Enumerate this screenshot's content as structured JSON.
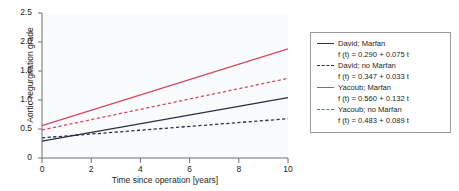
{
  "chart_data": {
    "type": "line",
    "title": "",
    "xlabel": "Time since operation [years]",
    "ylabel": "Aortic regurgitation grade",
    "xlim": [
      0,
      10
    ],
    "ylim": [
      0,
      2.5
    ],
    "xticks": [
      "0",
      "2",
      "4",
      "6",
      "8",
      "10"
    ],
    "yticks": [
      "0",
      "0.5",
      "1.0",
      "1.5",
      "2.0",
      "2.5"
    ],
    "grid": false,
    "legend_position": "right-outside",
    "x": [
      0,
      10
    ],
    "series": [
      {
        "name": "David; Marfan",
        "equation": "f (t) = 0.290 + 0.075 t",
        "intercept": 0.29,
        "slope": 0.075,
        "values": [
          0.29,
          1.04
        ],
        "color": "#2b3040",
        "style": "solid"
      },
      {
        "name": "David; no Marfan",
        "equation": "f (t) = 0.347 + 0.033 t",
        "intercept": 0.347,
        "slope": 0.033,
        "values": [
          0.347,
          0.677
        ],
        "color": "#2b3040",
        "style": "dashed"
      },
      {
        "name": "Yacoub; Marfan",
        "equation": "f (t) = 0.560 + 0.132 t",
        "intercept": 0.56,
        "slope": 0.132,
        "values": [
          0.56,
          1.88
        ],
        "color": "#d4495c",
        "style": "solid"
      },
      {
        "name": "Yacoub; no Marfan",
        "equation": "f (t) = 0.483 + 0.089 t",
        "intercept": 0.483,
        "slope": 0.089,
        "values": [
          0.483,
          1.373
        ],
        "color": "#d4495c",
        "style": "dashed"
      }
    ]
  },
  "axis": {
    "y_label": "Aortic regurgitation grade",
    "x_label": "Time since operation [years]",
    "y_ticks": [
      "2.5",
      "2.0",
      "1.5",
      "1.0",
      "0.5",
      "0"
    ],
    "x_ticks": [
      "0",
      "2",
      "4",
      "6",
      "8",
      "10"
    ]
  },
  "legend": {
    "entries": [
      {
        "label": "David; Marfan",
        "equation": "f (t) = 0.290 + 0.075 t"
      },
      {
        "label": "David; no Marfan",
        "equation": "f (t) = 0.347 + 0.033 t"
      },
      {
        "label": "Yacoub; Marfan",
        "equation": "f (t) = 0.560 + 0.132 t"
      },
      {
        "label": "Yacoub; no Marfan",
        "equation": "f (t) = 0.483 + 0.089 t"
      }
    ]
  },
  "colors": {
    "david": "#2b3040",
    "yacoub": "#d4495c",
    "axis": "#6d6e71",
    "plot_bg": "#fafbfc"
  }
}
